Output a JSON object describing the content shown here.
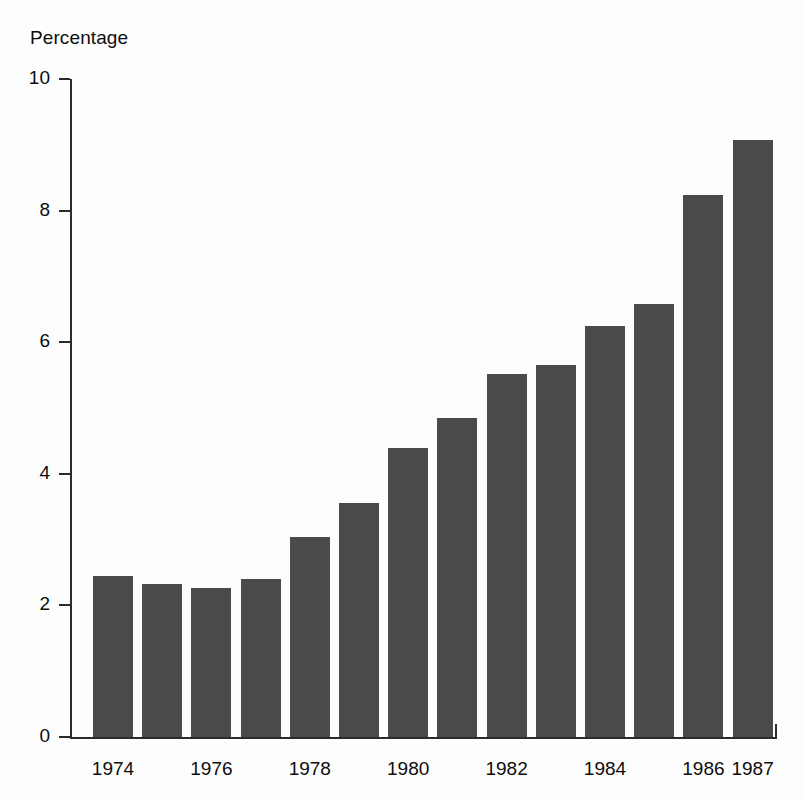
{
  "chart_data": {
    "type": "bar",
    "title": "",
    "subtitle": "",
    "ylabel": "Percentage",
    "xlabel": "",
    "ylim": [
      0,
      10
    ],
    "yticks": [
      0,
      2,
      4,
      6,
      8,
      10
    ],
    "ytick_labels": [
      "0",
      "2",
      "4",
      "6",
      "8",
      "10"
    ],
    "grid": false,
    "legend": null,
    "bar_color": "#4a4a4a",
    "axis_color": "#2b2b2b",
    "background_color": "#ffffff",
    "categories": [
      "1974",
      "1975",
      "1976",
      "1977",
      "1978",
      "1979",
      "1980",
      "1981",
      "1982",
      "1983",
      "1984",
      "1985",
      "1986",
      "1987"
    ],
    "values": [
      2.44,
      2.32,
      2.26,
      2.4,
      3.04,
      3.56,
      4.39,
      4.85,
      5.51,
      5.66,
      6.25,
      6.58,
      8.23,
      9.07
    ],
    "xtick_labels": [
      "1974",
      "1976",
      "1978",
      "1980",
      "1982",
      "1984",
      "1986",
      "1987"
    ],
    "xtick_categories": [
      "1974",
      "1976",
      "1978",
      "1980",
      "1982",
      "1984",
      "1986",
      "1987"
    ],
    "annotations": []
  }
}
